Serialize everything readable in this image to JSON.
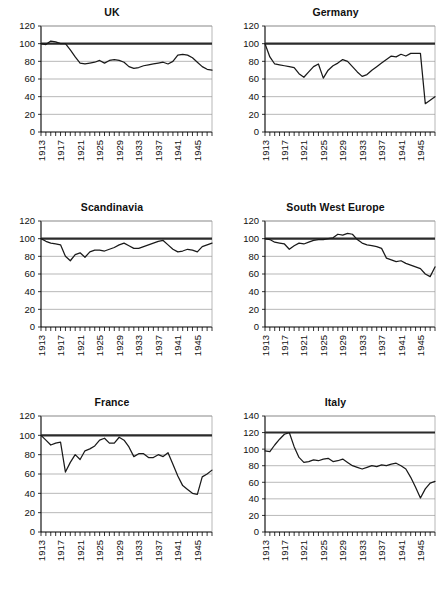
{
  "figure": {
    "panel_order": [
      "uk",
      "germany",
      "scandinavia",
      "swe",
      "france",
      "italy"
    ],
    "colors": {
      "axis": "#000000",
      "grid": "#9a9a9a",
      "reference": "#2b2b2b",
      "series": "#1a1a1a",
      "background": "#ffffff"
    }
  },
  "chart_data": [
    {
      "key": "uk",
      "type": "line",
      "title": "UK",
      "xlabel": "",
      "ylabel": "",
      "ylim": [
        0,
        120
      ],
      "yticks": [
        0,
        20,
        40,
        60,
        80,
        100,
        120
      ],
      "xlim": [
        1913,
        1948
      ],
      "xtick_labels": [
        "1913",
        "1917",
        "1921",
        "1925",
        "1929",
        "1933",
        "1937",
        "1941",
        "1945"
      ],
      "xtick_values": [
        1913,
        1917,
        1921,
        1925,
        1929,
        1933,
        1937,
        1941,
        1945
      ],
      "grid": true,
      "legend": "none",
      "reference_line": 100,
      "x": [
        1913,
        1914,
        1915,
        1916,
        1917,
        1918,
        1919,
        1920,
        1921,
        1922,
        1923,
        1924,
        1925,
        1926,
        1927,
        1928,
        1929,
        1930,
        1931,
        1932,
        1933,
        1934,
        1935,
        1936,
        1937,
        1938,
        1939,
        1940,
        1941,
        1942,
        1943,
        1944,
        1945,
        1946,
        1947,
        1948
      ],
      "values": [
        100,
        99,
        103,
        102,
        100,
        100,
        93,
        85,
        78,
        77,
        78,
        79,
        81,
        78,
        81,
        82,
        81,
        79,
        74,
        72,
        73,
        75,
        76,
        77,
        78,
        79,
        77,
        80,
        87,
        88,
        87,
        84,
        79,
        74,
        71,
        70
      ]
    },
    {
      "key": "germany",
      "type": "line",
      "title": "Germany",
      "xlabel": "",
      "ylabel": "",
      "ylim": [
        0,
        120
      ],
      "yticks": [
        0,
        20,
        40,
        60,
        80,
        100,
        120
      ],
      "xlim": [
        1913,
        1948
      ],
      "xtick_labels": [
        "1913",
        "1917",
        "1921",
        "1925",
        "1929",
        "1933",
        "1937",
        "1941",
        "1945"
      ],
      "xtick_values": [
        1913,
        1917,
        1921,
        1925,
        1929,
        1933,
        1937,
        1941,
        1945
      ],
      "grid": true,
      "legend": "none",
      "reference_line": 100,
      "x": [
        1913,
        1914,
        1915,
        1916,
        1917,
        1918,
        1919,
        1920,
        1921,
        1922,
        1923,
        1924,
        1925,
        1926,
        1927,
        1928,
        1929,
        1930,
        1931,
        1932,
        1933,
        1934,
        1935,
        1936,
        1937,
        1938,
        1939,
        1940,
        1941,
        1942,
        1943,
        1944,
        1945,
        1946,
        1947,
        1948
      ],
      "values": [
        100,
        85,
        77,
        76,
        75,
        74,
        73,
        66,
        62,
        68,
        74,
        77,
        61,
        70,
        75,
        78,
        82,
        80,
        74,
        68,
        63,
        65,
        70,
        74,
        78,
        82,
        86,
        85,
        88,
        86,
        89,
        89,
        89,
        32,
        36,
        40
      ]
    },
    {
      "key": "scandinavia",
      "type": "line",
      "title": "Scandinavia",
      "xlabel": "",
      "ylabel": "",
      "ylim": [
        0,
        120
      ],
      "yticks": [
        0,
        20,
        40,
        60,
        80,
        100,
        120
      ],
      "xlim": [
        1913,
        1948
      ],
      "xtick_labels": [
        "1913",
        "1917",
        "1921",
        "1925",
        "1929",
        "1933",
        "1937",
        "1941",
        "1945"
      ],
      "xtick_values": [
        1913,
        1917,
        1921,
        1925,
        1929,
        1933,
        1937,
        1941,
        1945
      ],
      "grid": true,
      "legend": "none",
      "reference_line": 100,
      "x": [
        1913,
        1914,
        1915,
        1916,
        1917,
        1918,
        1919,
        1920,
        1921,
        1922,
        1923,
        1924,
        1925,
        1926,
        1927,
        1928,
        1929,
        1930,
        1931,
        1932,
        1933,
        1934,
        1935,
        1936,
        1937,
        1938,
        1939,
        1940,
        1941,
        1942,
        1943,
        1944,
        1945,
        1946,
        1947,
        1948
      ],
      "values": [
        100,
        97,
        95,
        94,
        93,
        80,
        75,
        82,
        84,
        79,
        85,
        87,
        87,
        86,
        88,
        90,
        93,
        95,
        92,
        89,
        89,
        91,
        93,
        95,
        97,
        98,
        93,
        88,
        85,
        86,
        88,
        87,
        85,
        91,
        93,
        95
      ]
    },
    {
      "key": "swe",
      "type": "line",
      "title": "South West Europe",
      "xlabel": "",
      "ylabel": "",
      "ylim": [
        0,
        120
      ],
      "yticks": [
        0,
        20,
        40,
        60,
        80,
        100,
        120
      ],
      "xlim": [
        1913,
        1948
      ],
      "xtick_labels": [
        "1913",
        "1917",
        "1921",
        "1925",
        "1929",
        "1933",
        "1937",
        "1941",
        "1945"
      ],
      "xtick_values": [
        1913,
        1917,
        1921,
        1925,
        1929,
        1933,
        1937,
        1941,
        1945
      ],
      "grid": true,
      "legend": "none",
      "reference_line": 100,
      "x": [
        1913,
        1914,
        1915,
        1916,
        1917,
        1918,
        1919,
        1920,
        1921,
        1922,
        1923,
        1924,
        1925,
        1926,
        1927,
        1928,
        1929,
        1930,
        1931,
        1932,
        1933,
        1934,
        1935,
        1936,
        1937,
        1938,
        1939,
        1940,
        1941,
        1942,
        1943,
        1944,
        1945,
        1946,
        1947,
        1948
      ],
      "values": [
        100,
        99,
        96,
        95,
        94,
        88,
        92,
        95,
        94,
        96,
        98,
        99,
        99,
        100,
        101,
        105,
        104,
        106,
        105,
        99,
        95,
        93,
        92,
        91,
        89,
        78,
        76,
        74,
        75,
        72,
        70,
        68,
        66,
        60,
        57,
        68
      ]
    },
    {
      "key": "france",
      "type": "line",
      "title": "France",
      "xlabel": "",
      "ylabel": "",
      "ylim": [
        0,
        120
      ],
      "yticks": [
        0,
        20,
        40,
        60,
        80,
        100,
        120
      ],
      "xlim": [
        1913,
        1948
      ],
      "xtick_labels": [
        "1913",
        "1917",
        "1921",
        "1925",
        "1929",
        "1933",
        "1937",
        "1941",
        "1945"
      ],
      "xtick_values": [
        1913,
        1917,
        1921,
        1925,
        1929,
        1933,
        1937,
        1941,
        1945
      ],
      "grid": true,
      "legend": "none",
      "reference_line": 100,
      "x": [
        1913,
        1914,
        1915,
        1916,
        1917,
        1918,
        1919,
        1920,
        1921,
        1922,
        1923,
        1924,
        1925,
        1926,
        1927,
        1928,
        1929,
        1930,
        1931,
        1932,
        1933,
        1934,
        1935,
        1936,
        1937,
        1938,
        1939,
        1940,
        1941,
        1942,
        1943,
        1944,
        1945,
        1946,
        1947,
        1948
      ],
      "values": [
        100,
        95,
        90,
        92,
        93,
        62,
        72,
        80,
        75,
        84,
        86,
        89,
        95,
        97,
        92,
        92,
        98,
        95,
        88,
        78,
        81,
        81,
        77,
        77,
        80,
        78,
        82,
        70,
        58,
        48,
        44,
        40,
        39,
        57,
        60,
        64
      ]
    },
    {
      "key": "italy",
      "type": "line",
      "title": "Italy",
      "xlabel": "",
      "ylabel": "",
      "ylim": [
        0,
        140
      ],
      "yticks": [
        0,
        20,
        40,
        60,
        80,
        100,
        120,
        140
      ],
      "xlim": [
        1913,
        1948
      ],
      "xtick_labels": [
        "1913",
        "1917",
        "1921",
        "1925",
        "1929",
        "1933",
        "1937",
        "1941",
        "1945"
      ],
      "xtick_values": [
        1913,
        1917,
        1921,
        1925,
        1929,
        1933,
        1937,
        1941,
        1945
      ],
      "grid": true,
      "legend": "none",
      "reference_line": 120,
      "x": [
        1913,
        1914,
        1915,
        1916,
        1917,
        1918,
        1919,
        1920,
        1921,
        1922,
        1923,
        1924,
        1925,
        1926,
        1927,
        1928,
        1929,
        1930,
        1931,
        1932,
        1933,
        1934,
        1935,
        1936,
        1937,
        1938,
        1939,
        1940,
        1941,
        1942,
        1943,
        1944,
        1945,
        1946,
        1947,
        1948
      ],
      "values": [
        98,
        97,
        105,
        112,
        118,
        120,
        103,
        90,
        84,
        85,
        87,
        86,
        88,
        89,
        85,
        86,
        88,
        84,
        80,
        78,
        76,
        78,
        80,
        79,
        81,
        80,
        82,
        83,
        80,
        76,
        66,
        54,
        41,
        52,
        59,
        61
      ]
    }
  ]
}
